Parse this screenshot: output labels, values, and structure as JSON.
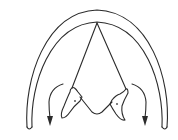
{
  "diagram": {
    "type": "line-drawing",
    "colors": {
      "background": "#ffffff",
      "line": "#2b2b2b"
    },
    "labels": [],
    "elements": [
      {
        "id": "outer-arch",
        "kind": "curve"
      },
      {
        "id": "inner-arch",
        "kind": "curve"
      },
      {
        "id": "central-triangle",
        "kind": "lines"
      },
      {
        "id": "left-process",
        "kind": "shape"
      },
      {
        "id": "right-process",
        "kind": "shape"
      },
      {
        "id": "left-arrow",
        "kind": "curved-arrow",
        "direction": "down-outward"
      },
      {
        "id": "right-arrow",
        "kind": "curved-arrow",
        "direction": "down-outward"
      }
    ]
  }
}
